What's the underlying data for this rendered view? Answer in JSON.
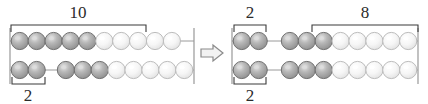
{
  "diagram": {
    "background_color": "#ffffff",
    "arrow": {
      "name": "transforms-into-arrow",
      "direction": "right",
      "glyph": "arrow-right-outline",
      "x": 212,
      "y": 53,
      "stroke_color": "#8a8a8a",
      "fill_color": "#f2f2f2"
    },
    "colors": {
      "bead_dark_fill": "#a8a8a8",
      "bead_dark_stroke": "#707070",
      "bead_dark_highlight": "#dcdcdc",
      "bead_light_fill": "#f4f4f4",
      "bead_light_stroke": "#bcbcbc",
      "bead_light_highlight": "#ffffff",
      "rod_color": "#9a9a9a",
      "frame_color": "#8f8f8f",
      "bracket_color": "#3a3a3a",
      "text_color": "#2b2b2b"
    },
    "abacuses": [
      {
        "id": "left-abacus",
        "name": "abacus-before",
        "frame": {
          "x": 10,
          "y": 28,
          "width": 184,
          "height": 56
        },
        "rows": [
          {
            "id": "left-top-row",
            "name": "bead-row-top",
            "y": 41,
            "total_beads": 10,
            "groups": [
              {
                "position": "left",
                "dark": 5,
                "light": 5,
                "count": 10
              }
            ]
          },
          {
            "id": "left-bottom-row",
            "name": "bead-row-bottom",
            "y": 70,
            "total_beads": 10,
            "groups": [
              {
                "position": "left",
                "dark": 2,
                "light": 0,
                "count": 2
              },
              {
                "position": "right",
                "dark": 3,
                "light": 5,
                "count": 8
              }
            ]
          }
        ],
        "brackets": [
          {
            "id": "left-bracket-10",
            "name": "bracket-label-10",
            "label": "10",
            "orientation": "top",
            "x_start": 11,
            "x_end": 146,
            "y": 25,
            "label_x": 78,
            "label_y": 18
          },
          {
            "id": "left-bracket-2",
            "name": "bracket-label-2",
            "label": "2",
            "orientation": "bottom",
            "x_start": 12,
            "x_end": 45,
            "y": 84,
            "label_x": 28,
            "label_y": 101
          }
        ]
      },
      {
        "id": "right-abacus",
        "name": "abacus-after",
        "frame": {
          "x": 232,
          "y": 28,
          "width": 186,
          "height": 56
        },
        "rows": [
          {
            "id": "right-top-row",
            "name": "bead-row-top",
            "y": 41,
            "total_beads": 10,
            "groups": [
              {
                "position": "left",
                "dark": 2,
                "light": 0,
                "count": 2
              },
              {
                "position": "right",
                "dark": 3,
                "light": 5,
                "count": 8
              }
            ]
          },
          {
            "id": "right-bottom-row",
            "name": "bead-row-bottom",
            "y": 70,
            "total_beads": 10,
            "groups": [
              {
                "position": "left",
                "dark": 2,
                "light": 0,
                "count": 2
              },
              {
                "position": "right",
                "dark": 3,
                "light": 5,
                "count": 8
              }
            ]
          }
        ],
        "brackets": [
          {
            "id": "right-bracket-2-top",
            "name": "bracket-label-2-top",
            "label": "2",
            "orientation": "top",
            "x_start": 234,
            "x_end": 266,
            "y": 25,
            "label_x": 250,
            "label_y": 18
          },
          {
            "id": "right-bracket-8",
            "name": "bracket-label-8",
            "label": "8",
            "orientation": "top",
            "x_start": 312,
            "x_end": 418,
            "y": 25,
            "label_x": 365,
            "label_y": 18
          },
          {
            "id": "right-bracket-2-bottom",
            "name": "bracket-label-2-bottom",
            "label": "2",
            "orientation": "bottom",
            "x_start": 234,
            "x_end": 266,
            "y": 84,
            "label_x": 250,
            "label_y": 101
          }
        ]
      }
    ]
  }
}
